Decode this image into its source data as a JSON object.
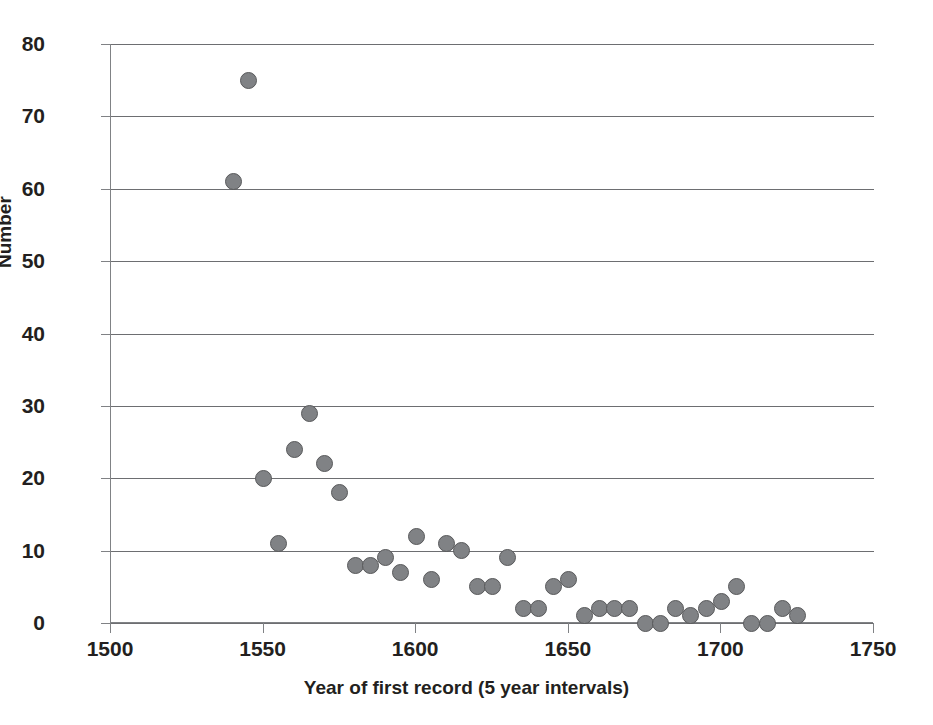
{
  "chart_data": {
    "type": "scatter",
    "title": "",
    "xlabel": "Year of first record (5 year intervals)",
    "ylabel": "Number",
    "xlim": [
      1500,
      1750
    ],
    "ylim": [
      0,
      80
    ],
    "xticks": [
      1500,
      1550,
      1600,
      1650,
      1700,
      1750
    ],
    "yticks": [
      0,
      10,
      20,
      30,
      40,
      50,
      60,
      70,
      80
    ],
    "grid": "horizontal",
    "legend": "none",
    "marker_fill": "#808285",
    "marker_edge": "#58595b",
    "series": [
      {
        "name": "Number of first records",
        "x": [
          1540,
          1545,
          1550,
          1555,
          1560,
          1565,
          1570,
          1575,
          1580,
          1585,
          1590,
          1595,
          1600,
          1605,
          1610,
          1615,
          1620,
          1625,
          1630,
          1635,
          1640,
          1645,
          1650,
          1655,
          1660,
          1665,
          1670,
          1675,
          1680,
          1685,
          1690,
          1695,
          1700,
          1705,
          1710,
          1715,
          1720,
          1725
        ],
        "y": [
          61,
          75,
          20,
          11,
          24,
          29,
          22,
          18,
          8,
          8,
          9,
          7,
          12,
          6,
          11,
          10,
          5,
          5,
          9,
          2,
          2,
          5,
          6,
          1,
          2,
          2,
          2,
          0,
          0,
          2,
          1,
          2,
          3,
          5,
          0,
          0,
          2,
          1
        ]
      }
    ],
    "points": [
      {
        "x": 1540,
        "y": 61
      },
      {
        "x": 1545,
        "y": 75
      },
      {
        "x": 1550,
        "y": 20
      },
      {
        "x": 1555,
        "y": 11
      },
      {
        "x": 1560,
        "y": 24
      },
      {
        "x": 1565,
        "y": 29
      },
      {
        "x": 1570,
        "y": 22
      },
      {
        "x": 1575,
        "y": 18
      },
      {
        "x": 1580,
        "y": 8
      },
      {
        "x": 1585,
        "y": 8
      },
      {
        "x": 1590,
        "y": 9
      },
      {
        "x": 1595,
        "y": 7
      },
      {
        "x": 1600,
        "y": 12
      },
      {
        "x": 1605,
        "y": 6
      },
      {
        "x": 1610,
        "y": 11
      },
      {
        "x": 1615,
        "y": 10
      },
      {
        "x": 1620,
        "y": 5
      },
      {
        "x": 1625,
        "y": 5
      },
      {
        "x": 1630,
        "y": 9
      },
      {
        "x": 1635,
        "y": 2
      },
      {
        "x": 1640,
        "y": 2
      },
      {
        "x": 1645,
        "y": 5
      },
      {
        "x": 1650,
        "y": 6
      },
      {
        "x": 1655,
        "y": 1
      },
      {
        "x": 1660,
        "y": 2
      },
      {
        "x": 1665,
        "y": 2
      },
      {
        "x": 1670,
        "y": 2
      },
      {
        "x": 1675,
        "y": 0
      },
      {
        "x": 1680,
        "y": 0
      },
      {
        "x": 1685,
        "y": 2
      },
      {
        "x": 1690,
        "y": 1
      },
      {
        "x": 1695,
        "y": 2
      },
      {
        "x": 1700,
        "y": 3
      },
      {
        "x": 1705,
        "y": 5
      },
      {
        "x": 1710,
        "y": 0
      },
      {
        "x": 1715,
        "y": 0
      },
      {
        "x": 1720,
        "y": 2
      },
      {
        "x": 1725,
        "y": 1
      }
    ]
  }
}
